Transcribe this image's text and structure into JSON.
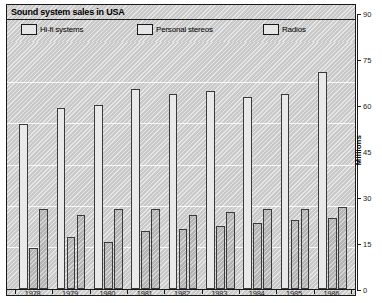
{
  "title": "Sound system sales in USA",
  "legend": [
    {
      "label": "Hi-fi systems",
      "key": "hifi"
    },
    {
      "label": "Personal stereos",
      "key": "personal_stereos"
    },
    {
      "label": "Radios",
      "key": "radios"
    }
  ],
  "axis": {
    "y_title": "Millions",
    "y_ticks": [
      "0",
      "15",
      "30",
      "45",
      "60",
      "75",
      "90"
    ],
    "x_labels": [
      "1978",
      "1979",
      "1980",
      "1981",
      "1982",
      "1983",
      "1984",
      "1985",
      "1986"
    ]
  },
  "colors": {
    "background": "#c9c9c9",
    "frame": "#1a1a1a",
    "gridline": "#ffffff",
    "bar_hifi": "#e9e9e9",
    "bar_personal_stereos": "#b4b4b4",
    "bar_radios": "#b4b4b4"
  },
  "chart_data": {
    "type": "bar",
    "title": "Sound system sales in USA",
    "xlabel": "",
    "ylabel": "Millions",
    "ylim": [
      0,
      90
    ],
    "yticks": [
      0,
      15,
      30,
      45,
      60,
      75,
      90
    ],
    "grid": true,
    "legend_position": "top",
    "categories": [
      "1978",
      "1979",
      "1980",
      "1981",
      "1982",
      "1983",
      "1984",
      "1985",
      "1986"
    ],
    "series": [
      {
        "name": "Hi-fi systems",
        "values": [
          60,
          66,
          67,
          73,
          71,
          72,
          70,
          71,
          79
        ]
      },
      {
        "name": "Personal stereos",
        "values": [
          15,
          19,
          17,
          21,
          22,
          23,
          24,
          25,
          26
        ]
      },
      {
        "name": "Radios",
        "values": [
          29,
          27,
          29,
          29,
          27,
          28,
          29,
          29,
          30
        ]
      }
    ]
  }
}
